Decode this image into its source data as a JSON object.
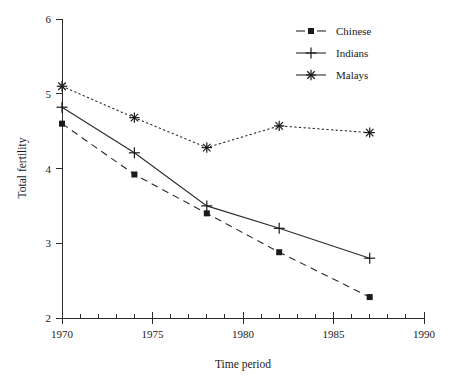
{
  "chart_data": {
    "type": "line",
    "title": "",
    "xlabel": "Time period",
    "ylabel": "Total fertility",
    "xlim": [
      1970,
      1990
    ],
    "ylim": [
      2,
      6
    ],
    "grid": false,
    "legend_position": "top-right",
    "x": [
      1970,
      1974,
      1978,
      1982,
      1987
    ],
    "xticks": [
      1970,
      1975,
      1980,
      1985,
      1990
    ],
    "xtick_labels": [
      "1970",
      "1975",
      "1980",
      "1985",
      "1990"
    ],
    "x_minor_tick_step": 1,
    "yticks": [
      2,
      3,
      4,
      5,
      6
    ],
    "ytick_labels": [
      "2",
      "3",
      "4",
      "5",
      "6"
    ],
    "series": [
      {
        "name": "Chinese",
        "marker": "square",
        "linestyle": "dashed",
        "color": "#1a1a1a",
        "values": [
          4.6,
          3.92,
          3.4,
          2.88,
          2.28
        ]
      },
      {
        "name": "Indians",
        "marker": "plus",
        "linestyle": "solid",
        "color": "#1a1a1a",
        "values": [
          4.82,
          4.21,
          3.5,
          3.2,
          2.8
        ]
      },
      {
        "name": "Malays",
        "marker": "star",
        "linestyle": "dotted",
        "color": "#1a1a1a",
        "values": [
          5.1,
          4.68,
          4.28,
          4.57,
          4.48
        ]
      }
    ]
  },
  "legend": {
    "entries": [
      {
        "label": "Chinese"
      },
      {
        "label": "Indians"
      },
      {
        "label": "Malays"
      }
    ]
  },
  "axes": {
    "x_title": "Time period",
    "y_title": "Total fertility"
  }
}
